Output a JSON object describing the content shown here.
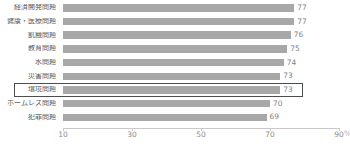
{
  "chart_data": {
    "type": "bar",
    "orientation": "horizontal",
    "title": "",
    "categories": [
      "経済開発問題",
      "健康・医療問題",
      "飢餓問題",
      "教育問題",
      "水問題",
      "災害問題",
      "環境問題",
      "ホームレス問題",
      "犯罪問題"
    ],
    "values": [
      77,
      77,
      76,
      75,
      74,
      73,
      73,
      70,
      69
    ],
    "highlighted_category": "環境問題",
    "highlighted_index": 6,
    "xlabel": "%",
    "ylabel": "",
    "xlim": [
      10,
      90
    ],
    "x_ticks": [
      10,
      30,
      50,
      70,
      90
    ],
    "grid": false,
    "legend": "none",
    "bar_color": "#a8a8a8",
    "highlight_border_color": "#4d4d4d"
  }
}
